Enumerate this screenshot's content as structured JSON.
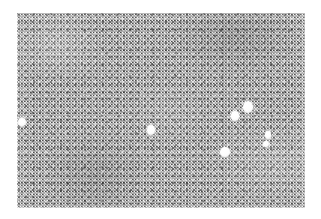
{
  "figure": {
    "kind": "micrograph",
    "caption": "",
    "canvas": {
      "width": 321,
      "height": 219,
      "background": "#ffffff"
    },
    "panel": {
      "name": "tissue-field",
      "left": 17,
      "top": 13,
      "width": 288,
      "height": 195,
      "base_gray": "#adadad",
      "texture": "fine-grained speckle / granular noise",
      "border": "none"
    },
    "features": {
      "label": "bright round inclusions",
      "color": "#ffffff",
      "count": 7,
      "items": [
        {
          "id": "droplet-1",
          "cx": 5,
          "cy": 109,
          "rx": 3.6,
          "ry": 4.0
        },
        {
          "id": "droplet-2",
          "cx": 134,
          "cy": 117,
          "rx": 4.2,
          "ry": 4.6
        },
        {
          "id": "droplet-3",
          "cx": 231,
          "cy": 94,
          "rx": 5.2,
          "ry": 6.0
        },
        {
          "id": "droplet-4",
          "cx": 218,
          "cy": 103,
          "rx": 4.4,
          "ry": 4.6
        },
        {
          "id": "droplet-5",
          "cx": 208,
          "cy": 139,
          "rx": 5.0,
          "ry": 4.6
        },
        {
          "id": "droplet-6",
          "cx": 251,
          "cy": 122,
          "rx": 2.8,
          "ry": 3.6
        },
        {
          "id": "droplet-7",
          "cx": 249,
          "cy": 131,
          "rx": 2.6,
          "ry": 3.2
        }
      ]
    }
  }
}
